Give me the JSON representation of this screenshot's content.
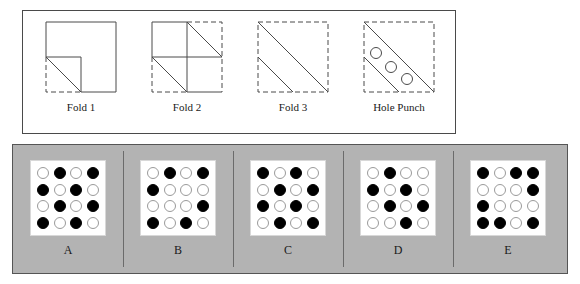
{
  "puzzle": {
    "type": "paper-folding-hole-punch",
    "fold_steps": [
      {
        "id": "fold-1",
        "label": "Fold 1",
        "description": "Square sheet with lower-left quadrant folded up along its diagonal; folded region shown dashed with diagonal crease."
      },
      {
        "id": "fold-2",
        "label": "Fold 2",
        "description": "Square divided into quadrants; right half and lower-left dashed, two diagonal creases visible."
      },
      {
        "id": "fold-3",
        "label": "Fold 3",
        "description": "Fully dashed square with two parallel diagonal creases running from upper-left toward lower-right."
      },
      {
        "id": "hole-punch",
        "label": "Hole Punch",
        "description": "Three circular holes punched in the band between the two parallel diagonals."
      }
    ],
    "options": [
      {
        "label": "A",
        "grid": [
          [
            "open",
            "filled",
            "open",
            "filled"
          ],
          [
            "filled",
            "open",
            "filled",
            "open"
          ],
          [
            "open",
            "filled",
            "open",
            "filled"
          ],
          [
            "filled",
            "open",
            "filled",
            "open"
          ]
        ]
      },
      {
        "label": "B",
        "grid": [
          [
            "open",
            "filled",
            "open",
            "filled"
          ],
          [
            "filled",
            "open",
            "open",
            "open"
          ],
          [
            "open",
            "open",
            "open",
            "filled"
          ],
          [
            "filled",
            "open",
            "filled",
            "open"
          ]
        ]
      },
      {
        "label": "C",
        "grid": [
          [
            "filled",
            "open",
            "filled",
            "open"
          ],
          [
            "open",
            "filled",
            "open",
            "filled"
          ],
          [
            "filled",
            "open",
            "filled",
            "open"
          ],
          [
            "open",
            "filled",
            "open",
            "filled"
          ]
        ]
      },
      {
        "label": "D",
        "grid": [
          [
            "open",
            "filled",
            "open",
            "open"
          ],
          [
            "filled",
            "open",
            "filled",
            "open"
          ],
          [
            "open",
            "filled",
            "open",
            "filled"
          ],
          [
            "open",
            "open",
            "filled",
            "open"
          ]
        ]
      },
      {
        "label": "E",
        "grid": [
          [
            "filled",
            "open",
            "filled",
            "filled"
          ],
          [
            "open",
            "open",
            "open",
            "filled"
          ],
          [
            "filled",
            "open",
            "open",
            "open"
          ],
          [
            "filled",
            "filled",
            "open",
            "filled"
          ]
        ]
      }
    ]
  },
  "colors": {
    "panel_background": "#b3b3b3",
    "panel_border": "#555555",
    "grid_background": "#ffffff",
    "dot_filled": "#000000",
    "dot_open_border": "#9a9a9a",
    "line": "#4a4a4a"
  }
}
